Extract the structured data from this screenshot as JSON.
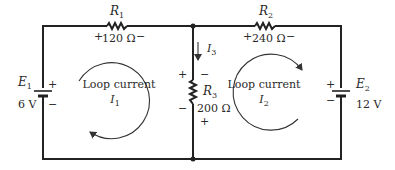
{
  "diagram": {
    "type": "two-loop DC circuit (mesh analysis)",
    "resistors": [
      {
        "id": "R1",
        "name": "R",
        "sub": "1",
        "value": "120 Ω",
        "plus": "+",
        "minus": "−"
      },
      {
        "id": "R2",
        "name": "R",
        "sub": "2",
        "value": "240 Ω",
        "plus": "+",
        "minus": "−"
      },
      {
        "id": "R3",
        "name": "R",
        "sub": "3",
        "value": "200 Ω",
        "plus": "+",
        "minus": "−"
      }
    ],
    "sources": [
      {
        "id": "E1",
        "name": "E",
        "sub": "1",
        "value": "6 V",
        "plus": "+",
        "minus": "−"
      },
      {
        "id": "E2",
        "name": "E",
        "sub": "2",
        "value": "12 V",
        "plus": "+",
        "minus": "−"
      }
    ],
    "branch_current": {
      "name": "I",
      "sub": "3"
    },
    "loops": [
      {
        "label": "Loop current",
        "name": "I",
        "sub": "1",
        "direction": "counterclockwise"
      },
      {
        "label": "Loop current",
        "name": "I",
        "sub": "2",
        "direction": "clockwise"
      }
    ],
    "r3_outer_plus": "+",
    "r3_outer_minus": "−",
    "r3_inner_minus": "−",
    "r3_inner_plus": "+"
  }
}
